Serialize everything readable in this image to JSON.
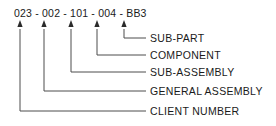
{
  "diagram": {
    "title_code": "023 - 002 - 101 - 004 - BB3",
    "code_segments": [
      "023",
      "002",
      "101",
      "004",
      "BB3"
    ],
    "separator": "-",
    "line_color": "#4d4d4d",
    "text_color": "#1a1a1a",
    "background_color": "#ffffff",
    "callouts": [
      {
        "id": "sub-part",
        "label": "SUB-PART",
        "segment": "BB3",
        "segment_index": 4,
        "arrow_x": 124,
        "elbow_y": 38,
        "dash_x_start": 131,
        "dash_x_end": 146
      },
      {
        "id": "component",
        "label": "COMPONENT",
        "segment": "004",
        "segment_index": 3,
        "arrow_x": 97,
        "elbow_y": 55,
        "dash_x_start": 104,
        "dash_x_end": 146
      },
      {
        "id": "sub-assembly",
        "label": "SUB-ASSEMBLY",
        "segment": "101",
        "segment_index": 2,
        "arrow_x": 71,
        "elbow_y": 72,
        "dash_x_start": 78,
        "dash_x_end": 146
      },
      {
        "id": "general-assembly",
        "label": "GENERAL ASSEMBLY",
        "segment": "002",
        "segment_index": 1,
        "arrow_x": 44,
        "elbow_y": 91,
        "dash_x_start": 51,
        "dash_x_end": 146
      },
      {
        "id": "client-number",
        "label": "CLIENT NUMBER",
        "segment": "023",
        "segment_index": 0,
        "arrow_x": 20,
        "elbow_y": 111,
        "dash_x_start": 27,
        "dash_x_end": 146
      }
    ],
    "arrow_tip_y": 20,
    "arrow_tail_y": 29
  }
}
